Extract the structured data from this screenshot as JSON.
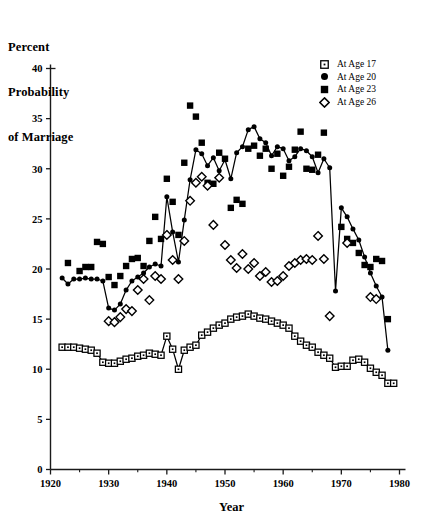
{
  "axis_title_block": [
    "Percent",
    "Probability",
    "of Marriage"
  ],
  "legend": {
    "position": "top-right",
    "entries": [
      {
        "label": "At Age 17",
        "marker": "square-open-dot-icon",
        "color": "#000000"
      },
      {
        "label": "At Age 20",
        "marker": "circle-filled-icon",
        "color": "#000000"
      },
      {
        "label": "At Age 23",
        "marker": "square-filled-icon",
        "color": "#000000"
      },
      {
        "label": "At Age 26",
        "marker": "diamond-open-icon",
        "color": "#000000"
      }
    ]
  },
  "chart_data": {
    "type": "scatter",
    "title": "Percent Probability of Marriage",
    "xlabel": "Year",
    "ylabel": "Percent Probability of Marriage",
    "xlim": [
      1920,
      1980
    ],
    "ylim": [
      0,
      40
    ],
    "xticks": [
      1920,
      1930,
      1940,
      1950,
      1960,
      1970,
      1980
    ],
    "xminor_ticks": [
      1925,
      1935,
      1945,
      1955,
      1965,
      1975
    ],
    "yticks": [
      0,
      5,
      10,
      15,
      20,
      25,
      30,
      35,
      40
    ],
    "grid": false,
    "series": [
      {
        "name": "At Age 17",
        "marker": "square-open-dot",
        "connected": true,
        "points": [
          [
            1922,
            12.2
          ],
          [
            1923,
            12.2
          ],
          [
            1924,
            12.2
          ],
          [
            1925,
            12.1
          ],
          [
            1926,
            12.0
          ],
          [
            1927,
            11.9
          ],
          [
            1928,
            11.6
          ],
          [
            1929,
            10.7
          ],
          [
            1930,
            10.6
          ],
          [
            1931,
            10.6
          ],
          [
            1932,
            10.8
          ],
          [
            1933,
            11.0
          ],
          [
            1934,
            11.1
          ],
          [
            1935,
            11.3
          ],
          [
            1936,
            11.4
          ],
          [
            1937,
            11.6
          ],
          [
            1938,
            11.5
          ],
          [
            1939,
            11.4
          ],
          [
            1940,
            13.3
          ],
          [
            1941,
            12.0
          ],
          [
            1942,
            10.0
          ],
          [
            1943,
            11.9
          ],
          [
            1944,
            12.2
          ],
          [
            1945,
            12.4
          ],
          [
            1946,
            13.4
          ],
          [
            1947,
            13.7
          ],
          [
            1948,
            14.1
          ],
          [
            1949,
            14.4
          ],
          [
            1950,
            14.6
          ],
          [
            1951,
            15.0
          ],
          [
            1952,
            15.2
          ],
          [
            1953,
            15.3
          ],
          [
            1954,
            15.5
          ],
          [
            1955,
            15.3
          ],
          [
            1956,
            15.1
          ],
          [
            1957,
            15.0
          ],
          [
            1958,
            14.8
          ],
          [
            1959,
            14.6
          ],
          [
            1960,
            14.4
          ],
          [
            1961,
            14.1
          ],
          [
            1962,
            13.3
          ],
          [
            1963,
            12.8
          ],
          [
            1964,
            12.4
          ],
          [
            1965,
            12.2
          ],
          [
            1966,
            11.7
          ],
          [
            1967,
            11.4
          ],
          [
            1968,
            11.1
          ],
          [
            1969,
            10.2
          ],
          [
            1970,
            10.3
          ],
          [
            1971,
            10.3
          ],
          [
            1972,
            10.9
          ],
          [
            1973,
            11.0
          ],
          [
            1974,
            10.7
          ],
          [
            1975,
            10.1
          ],
          [
            1976,
            9.7
          ],
          [
            1977,
            9.4
          ],
          [
            1978,
            8.6
          ],
          [
            1979,
            8.6
          ]
        ]
      },
      {
        "name": "At Age 20",
        "marker": "circle-filled",
        "connected": true,
        "points": [
          [
            1922,
            19.1
          ],
          [
            1923,
            18.5
          ],
          [
            1924,
            19.0
          ],
          [
            1925,
            19.0
          ],
          [
            1926,
            19.1
          ],
          [
            1927,
            19.0
          ],
          [
            1928,
            19.0
          ],
          [
            1929,
            18.8
          ],
          [
            1930,
            16.1
          ],
          [
            1931,
            15.9
          ],
          [
            1932,
            16.5
          ],
          [
            1933,
            17.9
          ],
          [
            1934,
            18.8
          ],
          [
            1935,
            19.2
          ],
          [
            1936,
            19.6
          ],
          [
            1937,
            20.2
          ],
          [
            1938,
            20.5
          ],
          [
            1939,
            20.3
          ],
          [
            1940,
            27.2
          ],
          [
            1941,
            23.7
          ],
          [
            1942,
            20.7
          ],
          [
            1943,
            24.9
          ],
          [
            1944,
            28.9
          ],
          [
            1945,
            31.9
          ],
          [
            1946,
            31.5
          ],
          [
            1947,
            30.3
          ],
          [
            1948,
            31.1
          ],
          [
            1949,
            29.8
          ],
          [
            1950,
            30.9
          ],
          [
            1951,
            29.0
          ],
          [
            1952,
            31.6
          ],
          [
            1953,
            32.2
          ],
          [
            1954,
            33.9
          ],
          [
            1955,
            34.2
          ],
          [
            1956,
            33.0
          ],
          [
            1957,
            32.6
          ],
          [
            1958,
            31.3
          ],
          [
            1959,
            32.2
          ],
          [
            1960,
            32.0
          ],
          [
            1961,
            30.8
          ],
          [
            1962,
            31.2
          ],
          [
            1963,
            32.0
          ],
          [
            1964,
            31.8
          ],
          [
            1965,
            31.2
          ],
          [
            1966,
            29.6
          ],
          [
            1967,
            31.0
          ],
          [
            1968,
            30.1
          ],
          [
            1969,
            17.8
          ],
          [
            1970,
            26.1
          ],
          [
            1971,
            25.2
          ],
          [
            1972,
            24.0
          ],
          [
            1973,
            22.9
          ],
          [
            1974,
            21.2
          ],
          [
            1975,
            19.6
          ],
          [
            1976,
            18.3
          ],
          [
            1977,
            17.2
          ],
          [
            1978,
            11.9
          ]
        ]
      },
      {
        "name": "At Age 23",
        "marker": "square-filled",
        "connected": false,
        "points": [
          [
            1923,
            20.6
          ],
          [
            1925,
            19.8
          ],
          [
            1926,
            20.2
          ],
          [
            1927,
            20.2
          ],
          [
            1928,
            22.7
          ],
          [
            1929,
            22.5
          ],
          [
            1930,
            19.2
          ],
          [
            1931,
            18.4
          ],
          [
            1932,
            19.3
          ],
          [
            1933,
            20.3
          ],
          [
            1934,
            21.0
          ],
          [
            1935,
            21.1
          ],
          [
            1936,
            20.3
          ],
          [
            1937,
            22.8
          ],
          [
            1938,
            25.2
          ],
          [
            1939,
            23.0
          ],
          [
            1940,
            29.0
          ],
          [
            1941,
            26.7
          ],
          [
            1942,
            23.4
          ],
          [
            1943,
            30.6
          ],
          [
            1944,
            36.3
          ],
          [
            1945,
            35.2
          ],
          [
            1946,
            32.6
          ],
          [
            1947,
            28.6
          ],
          [
            1948,
            28.5
          ],
          [
            1949,
            31.6
          ],
          [
            1950,
            31.0
          ],
          [
            1951,
            26.1
          ],
          [
            1952,
            26.9
          ],
          [
            1953,
            26.5
          ],
          [
            1954,
            32.0
          ],
          [
            1955,
            32.3
          ],
          [
            1956,
            31.3
          ],
          [
            1957,
            32.0
          ],
          [
            1958,
            30.0
          ],
          [
            1959,
            31.5
          ],
          [
            1960,
            29.3
          ],
          [
            1961,
            30.2
          ],
          [
            1962,
            31.9
          ],
          [
            1963,
            33.7
          ],
          [
            1964,
            30.0
          ],
          [
            1965,
            29.9
          ],
          [
            1966,
            31.4
          ],
          [
            1967,
            33.6
          ],
          [
            1970,
            24.2
          ],
          [
            1971,
            23.0
          ],
          [
            1972,
            22.6
          ],
          [
            1973,
            21.6
          ],
          [
            1974,
            20.4
          ],
          [
            1975,
            20.2
          ],
          [
            1976,
            21.0
          ],
          [
            1977,
            20.8
          ],
          [
            1978,
            15.0
          ]
        ]
      },
      {
        "name": "At Age 26",
        "marker": "diamond-open",
        "connected": false,
        "points": [
          [
            1930,
            14.8
          ],
          [
            1931,
            14.7
          ],
          [
            1932,
            15.2
          ],
          [
            1933,
            16.0
          ],
          [
            1934,
            15.8
          ],
          [
            1935,
            17.9
          ],
          [
            1936,
            19.0
          ],
          [
            1937,
            16.9
          ],
          [
            1938,
            19.3
          ],
          [
            1939,
            19.0
          ],
          [
            1940,
            23.4
          ],
          [
            1941,
            20.9
          ],
          [
            1942,
            19.0
          ],
          [
            1943,
            22.8
          ],
          [
            1944,
            26.8
          ],
          [
            1945,
            28.6
          ],
          [
            1946,
            29.2
          ],
          [
            1947,
            28.3
          ],
          [
            1948,
            24.4
          ],
          [
            1949,
            29.1
          ],
          [
            1950,
            22.4
          ],
          [
            1951,
            20.9
          ],
          [
            1952,
            20.1
          ],
          [
            1953,
            21.5
          ],
          [
            1954,
            20.0
          ],
          [
            1955,
            20.6
          ],
          [
            1956,
            19.3
          ],
          [
            1957,
            19.7
          ],
          [
            1958,
            18.7
          ],
          [
            1959,
            18.8
          ],
          [
            1960,
            19.3
          ],
          [
            1961,
            20.3
          ],
          [
            1962,
            20.6
          ],
          [
            1963,
            20.9
          ],
          [
            1964,
            21.0
          ],
          [
            1965,
            20.9
          ],
          [
            1966,
            23.3
          ],
          [
            1967,
            21.0
          ],
          [
            1968,
            15.3
          ],
          [
            1971,
            22.6
          ],
          [
            1975,
            17.2
          ],
          [
            1976,
            17.0
          ]
        ]
      }
    ]
  }
}
